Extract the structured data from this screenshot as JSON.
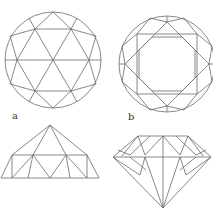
{
  "figure": {
    "labels": {
      "a": "a",
      "b": "b"
    },
    "panels": [
      {
        "id": "a-top",
        "name": "rose cut top view"
      },
      {
        "id": "b-top",
        "name": "brilliant cut top view"
      },
      {
        "id": "a-side",
        "name": "rose cut side view"
      },
      {
        "id": "b-side",
        "name": "brilliant cut side view"
      }
    ],
    "colors": {
      "line": "#6a6a6a",
      "background": "#ffffff",
      "label": "#333333"
    }
  }
}
